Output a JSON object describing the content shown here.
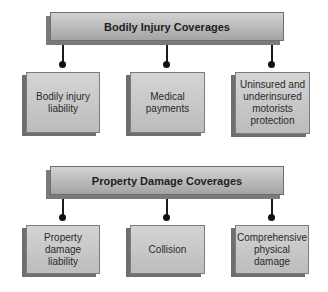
{
  "sections": [
    {
      "title": "Bodily Injury Coverages",
      "items": [
        {
          "label": "Bodily injury liability"
        },
        {
          "label": "Medical payments"
        },
        {
          "label": "Uninsured and underinsured motorists protection"
        }
      ]
    },
    {
      "title": "Property Damage Coverages",
      "items": [
        {
          "label": "Property damage liability"
        },
        {
          "label": "Collision"
        },
        {
          "label": "Comprehensive physical damage"
        }
      ]
    }
  ],
  "colors": {
    "box_fill_top": "#d2d2d2",
    "box_fill_bottom": "#a3a3a3",
    "shadow": "#7a7a7a",
    "connector": "#1a1a1a",
    "text": "#222222"
  }
}
